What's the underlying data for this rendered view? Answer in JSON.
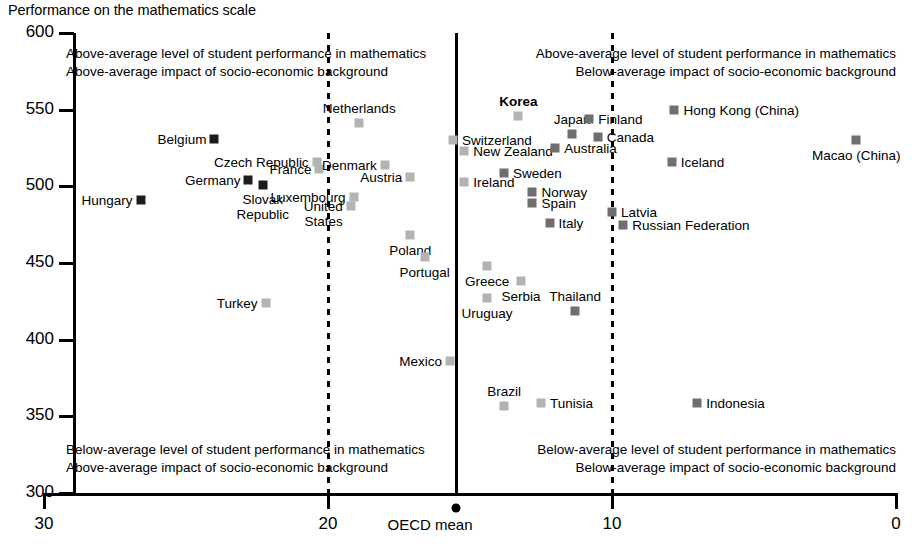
{
  "chart_data": {
    "type": "scatter",
    "title": "Performance on the mathematics scale",
    "xlabel": "OECD mean",
    "ylabel": "Performance on the mathematics scale",
    "xlim": [
      30,
      0
    ],
    "ylim": [
      300,
      600
    ],
    "x_ticks": [
      "30",
      "20",
      "10",
      "0"
    ],
    "x_tick_values": [
      30,
      20,
      10,
      0
    ],
    "y_ticks": [
      "300",
      "350",
      "400",
      "450",
      "500",
      "550",
      "600"
    ],
    "y_tick_values": [
      300,
      350,
      400,
      450,
      500,
      550,
      600
    ],
    "grid": false,
    "legend": "none",
    "x_axis_note": "x axis = impact of socio-economic background (percentage of variance explained), reversed: 30 at left, 0 at right",
    "reference_lines": [
      {
        "name": "dashed-left",
        "x": 20,
        "style": "dashed"
      },
      {
        "name": "oecd-mean",
        "x": 15.5,
        "style": "solid",
        "label": "OECD mean",
        "marker": "dot"
      },
      {
        "name": "dashed-right",
        "x": 10,
        "style": "dashed"
      }
    ],
    "marker_colors": {
      "dark": "#1c1c1c",
      "mid": "#6f6f6f",
      "light": "#b3b3b3"
    },
    "annotations": [
      {
        "name": "quadrant-top-left",
        "align": "left",
        "lines": [
          "Above-average level of student performance in mathematics",
          "Above-average impact of socio-economic background"
        ]
      },
      {
        "name": "quadrant-top-right",
        "align": "right",
        "lines": [
          "Above-average level of student performance in mathematics",
          "Below-average impact of socio-economic background"
        ]
      },
      {
        "name": "quadrant-bottom-left",
        "align": "left",
        "lines": [
          "Below-average level of student performance in mathematics",
          "Above-average impact of socio-economic background"
        ]
      },
      {
        "name": "quadrant-bottom-right",
        "align": "right",
        "lines": [
          "Below-average level of student performance in mathematics",
          "Below-average impact of socio-economic background"
        ]
      }
    ],
    "points": [
      {
        "label": "Hungary",
        "x": 26.6,
        "y": 491,
        "color": "dark",
        "label_pos": "left",
        "bold": false
      },
      {
        "label": "Belgium",
        "x": 24.0,
        "y": 531,
        "color": "dark",
        "label_pos": "left",
        "bold": false
      },
      {
        "label": "Germany",
        "x": 22.8,
        "y": 504,
        "color": "dark",
        "label_pos": "left",
        "bold": false
      },
      {
        "label": "Slovak\nRepublic",
        "x": 22.3,
        "y": 501,
        "color": "dark",
        "label_pos": "below",
        "bold": false
      },
      {
        "label": "Turkey",
        "x": 22.2,
        "y": 424,
        "color": "light",
        "label_pos": "left",
        "bold": false
      },
      {
        "label": "Czech Republic",
        "x": 20.4,
        "y": 516,
        "color": "light",
        "label_pos": "left",
        "bold": false
      },
      {
        "label": "France",
        "x": 20.3,
        "y": 511,
        "color": "light",
        "label_pos": "left",
        "bold": false
      },
      {
        "label": "Luxembourg",
        "x": 19.1,
        "y": 493,
        "color": "light",
        "label_pos": "left",
        "bold": false
      },
      {
        "label": "United\nStates",
        "x": 19.2,
        "y": 487,
        "color": "light",
        "label_pos": "left2",
        "bold": false
      },
      {
        "label": "Netherlands",
        "x": 18.9,
        "y": 541,
        "color": "light",
        "label_pos": "above",
        "bold": false
      },
      {
        "label": "Denmark",
        "x": 18.0,
        "y": 514,
        "color": "light",
        "label_pos": "left",
        "bold": false
      },
      {
        "label": "Austria",
        "x": 17.1,
        "y": 506,
        "color": "light",
        "label_pos": "left",
        "bold": false
      },
      {
        "label": "Poland",
        "x": 17.1,
        "y": 468,
        "color": "light",
        "label_pos": "below",
        "bold": false
      },
      {
        "label": "Portugal",
        "x": 16.6,
        "y": 454,
        "color": "light",
        "label_pos": "below",
        "bold": false
      },
      {
        "label": "Switzerland",
        "x": 15.6,
        "y": 530,
        "color": "light",
        "label_pos": "right",
        "bold": false
      },
      {
        "label": "New Zealand",
        "x": 15.2,
        "y": 523,
        "color": "light",
        "label_pos": "right",
        "bold": false
      },
      {
        "label": "Ireland",
        "x": 15.2,
        "y": 503,
        "color": "light",
        "label_pos": "right",
        "bold": false
      },
      {
        "label": "Mexico",
        "x": 15.7,
        "y": 386,
        "color": "light",
        "label_pos": "left",
        "bold": false
      },
      {
        "label": "Uruguay",
        "x": 14.4,
        "y": 427,
        "color": "light",
        "label_pos": "below",
        "bold": false
      },
      {
        "label": "Greece",
        "x": 14.4,
        "y": 448,
        "color": "light",
        "label_pos": "below",
        "bold": false
      },
      {
        "label": "Brazil",
        "x": 13.8,
        "y": 357,
        "color": "light",
        "label_pos": "above",
        "bold": false
      },
      {
        "label": "Sweden",
        "x": 13.8,
        "y": 509,
        "color": "mid",
        "label_pos": "right",
        "bold": false
      },
      {
        "label": "Korea",
        "x": 13.3,
        "y": 546,
        "color": "light",
        "label_pos": "above",
        "bold": true
      },
      {
        "label": "Serbia",
        "x": 13.2,
        "y": 438,
        "color": "light",
        "label_pos": "below",
        "bold": false
      },
      {
        "label": "Norway",
        "x": 12.8,
        "y": 496,
        "color": "mid",
        "label_pos": "right",
        "bold": false
      },
      {
        "label": "Spain",
        "x": 12.8,
        "y": 489,
        "color": "mid",
        "label_pos": "right",
        "bold": false
      },
      {
        "label": "Tunisia",
        "x": 12.5,
        "y": 359,
        "color": "light",
        "label_pos": "right",
        "bold": false
      },
      {
        "label": "Italy",
        "x": 12.2,
        "y": 476,
        "color": "mid",
        "label_pos": "right",
        "bold": false
      },
      {
        "label": "Australia",
        "x": 12.0,
        "y": 525,
        "color": "mid",
        "label_pos": "right",
        "bold": false
      },
      {
        "label": "Thailand",
        "x": 11.3,
        "y": 419,
        "color": "mid",
        "label_pos": "above",
        "bold": false
      },
      {
        "label": "Japan",
        "x": 11.4,
        "y": 534,
        "color": "mid",
        "label_pos": "above",
        "bold": false
      },
      {
        "label": "Finland",
        "x": 10.8,
        "y": 544,
        "color": "mid",
        "label_pos": "right",
        "bold": false
      },
      {
        "label": "Canada",
        "x": 10.5,
        "y": 532,
        "color": "mid",
        "label_pos": "right",
        "bold": false
      },
      {
        "label": "Latvia",
        "x": 10.0,
        "y": 483,
        "color": "mid",
        "label_pos": "right",
        "bold": false
      },
      {
        "label": "Russian Federation",
        "x": 9.6,
        "y": 475,
        "color": "mid",
        "label_pos": "right",
        "bold": false
      },
      {
        "label": "Hong Kong (China)",
        "x": 7.8,
        "y": 550,
        "color": "mid",
        "label_pos": "right",
        "bold": false
      },
      {
        "label": "Iceland",
        "x": 7.9,
        "y": 516,
        "color": "mid",
        "label_pos": "right",
        "bold": false
      },
      {
        "label": "Indonesia",
        "x": 7.0,
        "y": 359,
        "color": "mid",
        "label_pos": "right",
        "bold": false
      },
      {
        "label": "Macao (China)",
        "x": 1.4,
        "y": 530,
        "color": "mid",
        "label_pos": "below",
        "bold": false
      }
    ]
  }
}
